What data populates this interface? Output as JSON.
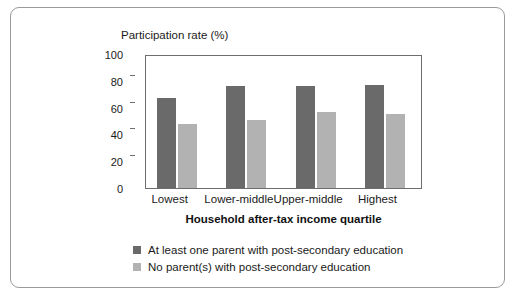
{
  "chart_data": {
    "type": "bar",
    "title": "Participation rate (%)",
    "xlabel": "Household after-tax income quartile",
    "ylabel": "",
    "categories": [
      "Lowest",
      "Lower-middle",
      "Upper-middle",
      "Highest"
    ],
    "series": [
      {
        "name": "At least one parent with post-secondary education",
        "color": "#6a6a6a",
        "values": [
          67,
          76,
          76,
          77
        ]
      },
      {
        "name": "No parent(s) with post-secondary education",
        "color": "#b2b2b2",
        "values": [
          48,
          51,
          57,
          55
        ]
      }
    ],
    "ylim": [
      0,
      100
    ],
    "yticks": [
      0,
      20,
      40,
      60,
      80,
      100
    ],
    "ytick_labels": [
      "0",
      "20",
      "40",
      "60",
      "80",
      "100"
    ],
    "grid": false,
    "legend_position": "bottom-left"
  },
  "legend": {
    "items": [
      {
        "label": "At least one parent with post-secondary education",
        "swatch": "#6a6a6a"
      },
      {
        "label": "No parent(s) with post-secondary education",
        "swatch": "#b2b2b2"
      }
    ]
  }
}
